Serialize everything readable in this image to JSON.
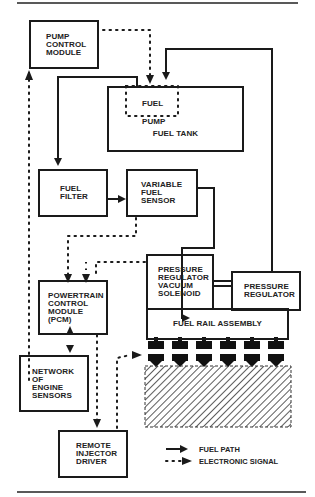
{
  "diagram": {
    "components": {
      "pump_control_module": "PUMP\nCONTROL\nMODULE",
      "fuel_pump": "FUEL\nPUMP",
      "fuel_tank": "FUEL TANK",
      "fuel_filter": "FUEL\nFILTER",
      "variable_fuel_sensor": "VARIABLE\nFUEL\nSENSOR",
      "pressure_regulator_vacuum_solenoid": "PRESSURE\nREGULATOR\nVACUUM\nSOLENOID",
      "pressure_regulator": "PRESSURE\nREGULATOR",
      "fuel_rail_assembly": "FUEL RAIL ASSEMBLY",
      "pcm": "POWERTRAIN\nCONTROL\nMODULE\n(PCM)",
      "engine_sensors": "NETWORK\nOF\nENGINE\nSENSORS",
      "remote_injector_driver": "REMOTE\nINJECTOR\nDRIVER"
    },
    "injector_count": 6,
    "legend": {
      "fuel_path": "FUEL PATH",
      "electronic_signal": "ELECTRONIC SIGNAL"
    },
    "colors": {
      "line": "#1a1a1a",
      "background": "#ffffff"
    }
  }
}
